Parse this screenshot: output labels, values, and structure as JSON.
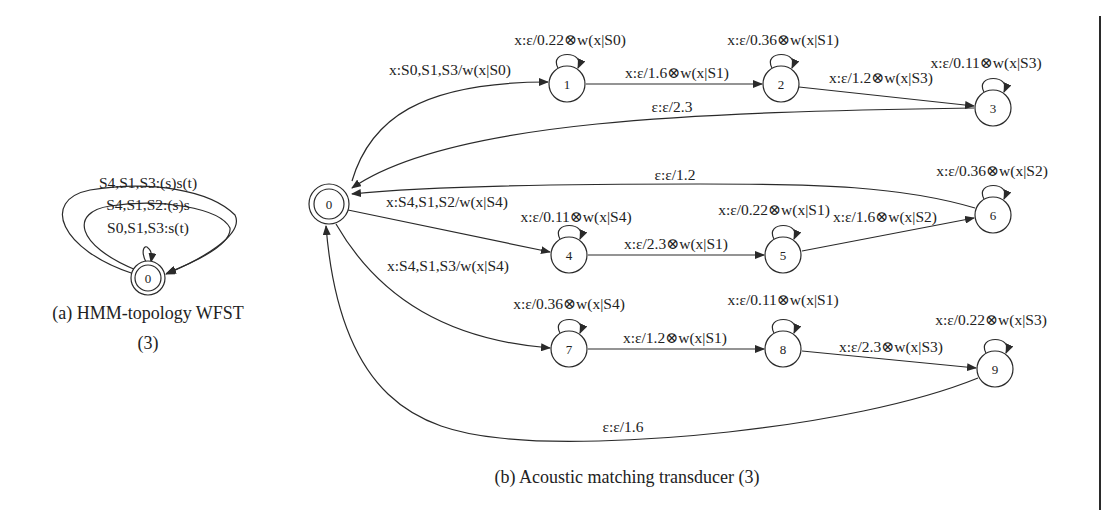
{
  "figure": {
    "header_partial": "",
    "panel_a": {
      "caption_line1": "(a) HMM-topology WFST",
      "caption_line2": "(3)",
      "node": "0",
      "arcs": [
        {
          "label": "S4,S1,S3:(s)s(t)"
        },
        {
          "label": "S4,S1,S2:(s)s"
        },
        {
          "label": "S0,S1,S3:s(t)"
        }
      ]
    },
    "panel_b": {
      "caption": "(b) Acoustic matching transducer (3)",
      "nodes": [
        "0",
        "1",
        "2",
        "3",
        "4",
        "5",
        "6",
        "7",
        "8",
        "9"
      ],
      "arcs": [
        {
          "from": "0",
          "to": "1",
          "label": "x:S0,S1,S3/w(x|S0)"
        },
        {
          "from": "1",
          "to": "1",
          "label": "x:ε/0.22⊗w(x|S0)"
        },
        {
          "from": "1",
          "to": "2",
          "label": "x:ε/1.6⊗w(x|S1)"
        },
        {
          "from": "2",
          "to": "2",
          "label": "x:ε/0.36⊗w(x|S1)"
        },
        {
          "from": "2",
          "to": "3",
          "label": "x:ε/1.2⊗w(x|S3)"
        },
        {
          "from": "3",
          "to": "3",
          "label": "x:ε/0.11⊗w(x|S3)"
        },
        {
          "from": "3",
          "to": "0",
          "label": "ε:ε/2.3"
        },
        {
          "from": "0",
          "to": "4",
          "label": "x:S4,S1,S2/w(x|S4)"
        },
        {
          "from": "4",
          "to": "4",
          "label": "x:ε/0.11⊗w(x|S4)"
        },
        {
          "from": "4",
          "to": "5",
          "label": "x:ε/2.3⊗w(x|S1)"
        },
        {
          "from": "5",
          "to": "5",
          "label": "x:ε/0.22⊗w(x|S1)"
        },
        {
          "from": "5",
          "to": "6",
          "label": "x:ε/1.6⊗w(x|S2)"
        },
        {
          "from": "6",
          "to": "6",
          "label": "x:ε/0.36⊗w(x|S2)"
        },
        {
          "from": "6",
          "to": "0",
          "label": "ε:ε/1.2"
        },
        {
          "from": "0",
          "to": "7",
          "label": "x:S4,S1,S3/w(x|S4)"
        },
        {
          "from": "7",
          "to": "7",
          "label": "x:ε/0.36⊗w(x|S4)"
        },
        {
          "from": "7",
          "to": "8",
          "label": "x:ε/1.2⊗w(x|S1)"
        },
        {
          "from": "8",
          "to": "8",
          "label": "x:ε/0.11⊗w(x|S1)"
        },
        {
          "from": "8",
          "to": "9",
          "label": "x:ε/2.3⊗w(x|S3)"
        },
        {
          "from": "9",
          "to": "9",
          "label": "x:ε/0.22⊗w(x|S3)"
        },
        {
          "from": "9",
          "to": "0",
          "label": "ε:ε/1.6"
        }
      ]
    }
  }
}
